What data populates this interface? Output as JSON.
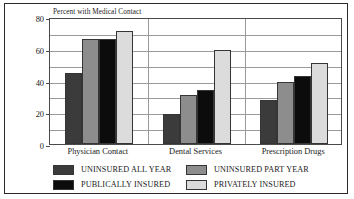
{
  "chart_data": {
    "type": "bar",
    "title": "Percent with Medical Contact",
    "xlabel": "",
    "ylabel": "",
    "ylim": [
      0,
      80
    ],
    "yticks": [
      0,
      20,
      40,
      60,
      80
    ],
    "yticklabels": [
      "0",
      "20",
      "40",
      "60",
      "80"
    ],
    "minor_tick_step": 10,
    "grid": true,
    "legend_position": "bottom",
    "categories": [
      "Physician Contact",
      "Dental Services",
      "Prescription Drugs"
    ],
    "series": [
      {
        "name": "UNINSURED ALL YEAR",
        "color": "#3b3b3b",
        "values": [
          45,
          19,
          28
        ]
      },
      {
        "name": "UNINSURED PART YEAR",
        "color": "#8d8d8d",
        "values": [
          66,
          31,
          39
        ]
      },
      {
        "name": "PUBLICALLY INSURED",
        "color": "#0c0c0c",
        "values": [
          66,
          34,
          43
        ]
      },
      {
        "name": "PRIVATELY INSURED",
        "color": "#dcdcdc",
        "values": [
          71,
          59,
          51
        ]
      }
    ]
  },
  "colors": {
    "frame": "#2a2a2a",
    "axis": "#4a4a4a",
    "grid": "#9a9a9a",
    "text": "#1a1a1a",
    "background": "#ffffff"
  }
}
